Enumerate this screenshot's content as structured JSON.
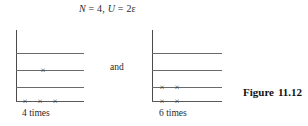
{
  "figure": {
    "title": {
      "particles_symbol": "N",
      "particles_value": "= 4,",
      "energy_symbol": "U",
      "energy_value": "= 2ε",
      "full_text": "N = 4, U = 2ε"
    },
    "conjunction": "and",
    "number_label": "Figure",
    "number_value": "11.12",
    "colors": {
      "line": "#6a6a6a",
      "axis": "#4a4a4a",
      "text": "#2a2a2a",
      "background": "#ffffff"
    },
    "diagrams": [
      {
        "id": "left-microstate",
        "caption": "4 times",
        "levels": [
          {
            "index": 3,
            "occupancy": 0
          },
          {
            "index": 2,
            "occupancy": 1
          },
          {
            "index": 1,
            "occupancy": 0
          },
          {
            "index": 0,
            "occupancy": 3
          }
        ],
        "marker_glyph": "×",
        "total_particles": 4,
        "multiplicity": 4
      },
      {
        "id": "right-microstate",
        "caption": "6 times",
        "levels": [
          {
            "index": 3,
            "occupancy": 0
          },
          {
            "index": 2,
            "occupancy": 0
          },
          {
            "index": 1,
            "occupancy": 2
          },
          {
            "index": 0,
            "occupancy": 2
          }
        ],
        "marker_glyph": "×",
        "total_particles": 4,
        "multiplicity": 6
      }
    ]
  }
}
